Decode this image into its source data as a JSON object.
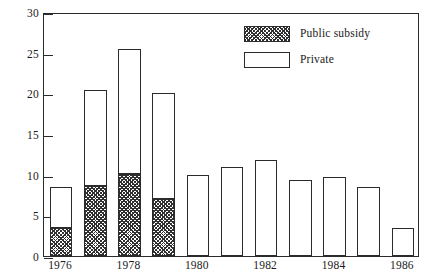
{
  "chart_data": {
    "type": "bar",
    "subtype": "stacked-bar",
    "title": "",
    "subtitle": "",
    "xlabel": "",
    "ylabel": "",
    "ylim": [
      0,
      30
    ],
    "ytick_values": [
      0,
      5,
      10,
      15,
      20,
      25,
      30
    ],
    "ytick_labels": [
      "0",
      "5",
      "10",
      "15",
      "20",
      "25",
      "30"
    ],
    "grid": false,
    "legend_position": "top-right",
    "categories": [
      "1976",
      "1977",
      "1978",
      "1979",
      "1980",
      "1981",
      "1982",
      "1983",
      "1984",
      "1985",
      "1986"
    ],
    "xtick_labels_shown": [
      "1976",
      "1978",
      "1980",
      "1982",
      "1984",
      "1986"
    ],
    "series": [
      {
        "name": "Public subsidy",
        "fill": "cross-hatch",
        "color": "#303030",
        "values": [
          3.4,
          8.6,
          10.1,
          7.0,
          0,
          0,
          0,
          0,
          0,
          0,
          0
        ]
      },
      {
        "name": "Private",
        "fill": "open",
        "color": "#ffffff",
        "values": [
          5.1,
          11.8,
          15.4,
          13.1,
          9.9,
          10.9,
          11.8,
          9.4,
          9.7,
          8.5,
          3.5
        ]
      }
    ],
    "totals": [
      8.5,
      20.4,
      25.5,
      20.1,
      9.9,
      10.9,
      11.8,
      9.4,
      9.7,
      8.5,
      3.5
    ]
  },
  "legend": {
    "items": [
      {
        "label": "Public subsidy",
        "swatch": "hatched-swatch"
      },
      {
        "label": "Private",
        "swatch": "open-swatch"
      }
    ]
  },
  "axes": {
    "y": {
      "labels": [
        "30",
        "25",
        "20",
        "15",
        "10",
        "5",
        "0"
      ]
    },
    "x": {
      "labels": [
        "1976",
        "1978",
        "1980",
        "1982",
        "1984",
        "1986"
      ]
    }
  }
}
